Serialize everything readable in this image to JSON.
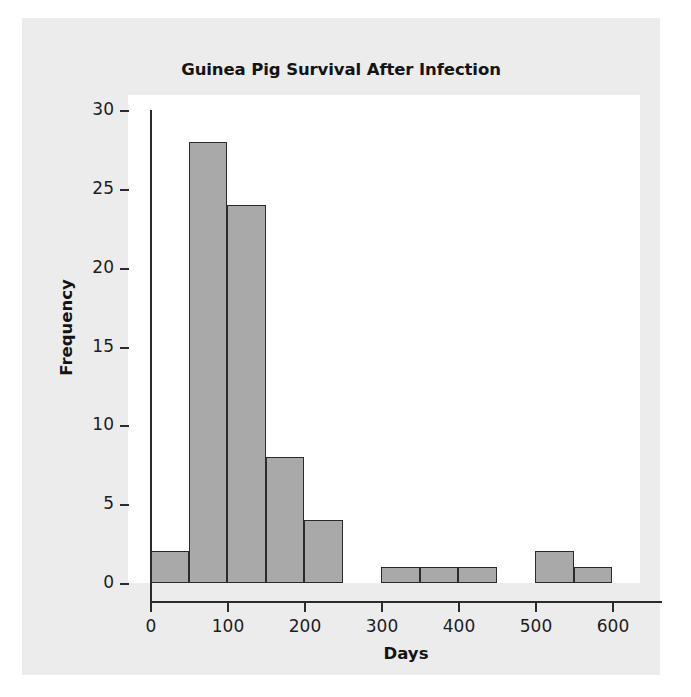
{
  "chart_data": {
    "type": "bar",
    "subtype": "histogram",
    "title": "Guinea Pig Survival After Infection",
    "xlabel": "Days",
    "ylabel": "Frequency",
    "bin_width": 50,
    "bin_edges": [
      0,
      50,
      100,
      150,
      200,
      250,
      300,
      350,
      400,
      450,
      500,
      550,
      600
    ],
    "categories": [
      "0-50",
      "50-100",
      "100-150",
      "150-200",
      "200-250",
      "250-300",
      "300-350",
      "350-400",
      "400-450",
      "450-500",
      "500-550",
      "550-600"
    ],
    "values": [
      2,
      28,
      24,
      8,
      4,
      0,
      1,
      1,
      1,
      0,
      2,
      1
    ],
    "xlim": [
      -30,
      640
    ],
    "ylim": [
      0,
      30
    ],
    "xticks": [
      0,
      100,
      200,
      300,
      400,
      500,
      600
    ],
    "xtick_labels": [
      "0",
      "100",
      "200",
      "300",
      "400",
      "500",
      "600"
    ],
    "yticks": [
      0,
      5,
      10,
      15,
      20,
      25,
      30
    ],
    "ytick_labels": [
      "0",
      "5",
      "10",
      "15",
      "20",
      "25",
      "30"
    ],
    "grid": false,
    "legend": null,
    "bar_fill_color": "#a9a9a9",
    "bar_edge_color": "#2b2b2b",
    "panel_background": "#ffffff",
    "figure_background": "#ececec"
  }
}
